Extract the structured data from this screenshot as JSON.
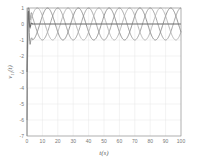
{
  "chart_data": {
    "type": "line",
    "title": "",
    "xlabel": "t(s)",
    "ylabel": "v_{1i}(t)",
    "xlim": [
      0,
      100
    ],
    "ylim": [
      -7,
      1
    ],
    "xticks": [
      0,
      10,
      20,
      30,
      40,
      50,
      60,
      70,
      80,
      90,
      100
    ],
    "yticks": [
      1,
      0,
      -1,
      -2,
      -3,
      -4,
      -5,
      -6,
      -7
    ],
    "grid": true,
    "legend": null,
    "series": [
      {
        "name": "agent 1",
        "form": "sin",
        "amplitude": 1,
        "period": 20,
        "phase_deg": 0,
        "color": "#9a9a9a",
        "transient_min": -7
      },
      {
        "name": "agent 2",
        "form": "sin",
        "amplitude": 1,
        "period": 20,
        "phase_deg": 120,
        "color": "#8a8a8a",
        "transient_min": -6
      },
      {
        "name": "agent 3",
        "form": "sin",
        "amplitude": 1,
        "period": 20,
        "phase_deg": 240,
        "color": "#b0b0b0",
        "transient_min": -4
      },
      {
        "name": "agent 4",
        "form": "const",
        "value": 0,
        "color": "#6e6e6e",
        "transient_min": -3
      }
    ]
  }
}
